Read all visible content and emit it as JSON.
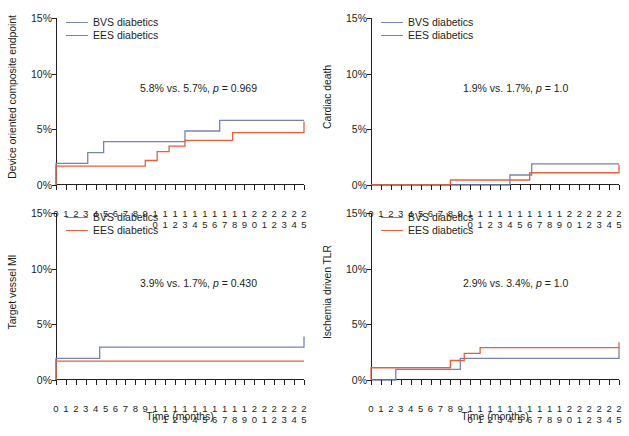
{
  "figure": {
    "xaxis_title": "Time (months)",
    "colors": {
      "bvs": "#7784ae",
      "ees": "#e8603b",
      "axis": "#231f20"
    }
  },
  "legend": {
    "bvs_label": "BVS diabetics",
    "ees_label": "EES diabetics"
  },
  "panels": {
    "tl": {
      "ylabel": "Device oriented composite endpoint",
      "annotation": "5.8% vs. 5.7%, p = 0.969",
      "annot_prefix": "5.8% vs. 5.7%, ",
      "annot_p": "p",
      "annot_suffix": " = 0.969"
    },
    "tr": {
      "ylabel": "Cardiac death",
      "annotation": "1.9% vs. 1.7%, p = 1.0",
      "annot_prefix": "1.9% vs. 1.7%, ",
      "annot_p": "p",
      "annot_suffix": " = 1.0"
    },
    "bl": {
      "ylabel": "Target vessel MI",
      "annotation": "3.9% vs. 1.7%, p = 0.430",
      "annot_prefix": "3.9% vs. 1.7%, ",
      "annot_p": "p",
      "annot_suffix": " = 0.430"
    },
    "br": {
      "ylabel": "Ischemia driven TLR",
      "annotation": "2.9% vs. 3.4%, p = 1.0",
      "annot_prefix": "2.9% vs. 3.4%, ",
      "annot_p": "p",
      "annot_suffix": " = 1.0"
    }
  },
  "axes": {
    "yticks": [
      "0%",
      "5%",
      "10%",
      "15%"
    ],
    "ytick_values": [
      0,
      5,
      10,
      15
    ],
    "ylim": [
      0,
      15
    ],
    "xlim": [
      0,
      25
    ],
    "xticks": [
      0,
      1,
      2,
      3,
      4,
      5,
      6,
      7,
      8,
      9,
      10,
      11,
      12,
      13,
      14,
      15,
      16,
      17,
      18,
      19,
      20,
      21,
      22,
      23,
      24,
      25
    ],
    "xtick_labels": [
      "0",
      "1",
      "2",
      "3",
      "4",
      "5",
      "6",
      "7",
      "8",
      "9",
      "10",
      "11",
      "12",
      "13",
      "14",
      "15",
      "16",
      "17",
      "18",
      "19",
      "20",
      "21",
      "22",
      "23",
      "24",
      "25"
    ]
  },
  "chart_data": [
    {
      "type": "line",
      "panel": "tl",
      "title": "Device oriented composite endpoint",
      "xlabel": "Time (months)",
      "ylabel": "Device oriented composite endpoint",
      "xlim": [
        0,
        25
      ],
      "ylim": [
        0,
        15
      ],
      "grid": false,
      "legend_position": "top-left",
      "annotation": "5.8% vs. 5.7%, p = 0.969",
      "series": [
        {
          "name": "BVS diabetics",
          "color": "#7784ae",
          "step": "post",
          "x": [
            0,
            0,
            2.4,
            3.2,
            4.8,
            13.0,
            16.5,
            25
          ],
          "y": [
            0,
            1.95,
            1.95,
            2.9,
            3.9,
            4.85,
            5.8,
            5.8
          ]
        },
        {
          "name": "EES diabetics",
          "color": "#e8603b",
          "step": "post",
          "x": [
            0,
            0,
            3.2,
            9.0,
            10.2,
            11.4,
            13.0,
            17.8,
            25
          ],
          "y": [
            0,
            1.7,
            1.7,
            2.2,
            3.0,
            3.5,
            4.0,
            4.7,
            5.7
          ]
        }
      ]
    },
    {
      "type": "line",
      "panel": "tr",
      "title": "Cardiac death",
      "xlabel": "Time (months)",
      "ylabel": "Cardiac death",
      "xlim": [
        0,
        25
      ],
      "ylim": [
        0,
        15
      ],
      "grid": false,
      "legend_position": "top-left",
      "annotation": "1.9% vs. 1.7%, p = 1.0",
      "series": [
        {
          "name": "BVS diabetics",
          "color": "#7784ae",
          "step": "post",
          "x": [
            0,
            13.0,
            14.0,
            16.2,
            25
          ],
          "y": [
            0,
            0,
            0.9,
            1.9,
            1.9
          ]
        },
        {
          "name": "EES diabetics",
          "color": "#e8603b",
          "step": "post",
          "x": [
            0,
            8.0,
            13.6,
            16.0,
            25
          ],
          "y": [
            0,
            0.45,
            0.45,
            1.1,
            1.85
          ]
        }
      ]
    },
    {
      "type": "line",
      "panel": "bl",
      "title": "Target vessel MI",
      "xlabel": "Time (months)",
      "ylabel": "Target vessel MI",
      "xlim": [
        0,
        25
      ],
      "ylim": [
        0,
        15
      ],
      "grid": false,
      "legend_position": "top-left",
      "annotation": "3.9% vs. 1.7%, p = 0.430",
      "series": [
        {
          "name": "BVS diabetics",
          "color": "#7784ae",
          "step": "post",
          "x": [
            0,
            0,
            2.4,
            4.4,
            25
          ],
          "y": [
            0,
            1.95,
            1.95,
            2.95,
            3.9
          ]
        },
        {
          "name": "EES diabetics",
          "color": "#e8603b",
          "step": "post",
          "x": [
            0,
            0,
            25
          ],
          "y": [
            0,
            1.7,
            1.7
          ]
        }
      ]
    },
    {
      "type": "line",
      "panel": "br",
      "title": "Ischemia driven TLR",
      "xlabel": "Time (months)",
      "ylabel": "Ischemia driven TLR",
      "xlim": [
        0,
        25
      ],
      "ylim": [
        0,
        15
      ],
      "grid": false,
      "legend_position": "top-left",
      "annotation": "2.9% vs. 3.4%, p = 1.0",
      "series": [
        {
          "name": "BVS diabetics",
          "color": "#7784ae",
          "step": "post",
          "x": [
            0,
            2.5,
            2.5,
            7.8,
            9.0,
            21.8,
            25
          ],
          "y": [
            0,
            0,
            0.95,
            0.95,
            1.95,
            1.95,
            2.9
          ]
        },
        {
          "name": "EES diabetics",
          "color": "#e8603b",
          "step": "post",
          "x": [
            0,
            0,
            4.0,
            8.0,
            9.4,
            11.0,
            25
          ],
          "y": [
            0,
            1.1,
            1.1,
            1.75,
            2.4,
            2.9,
            3.4
          ]
        }
      ]
    }
  ]
}
